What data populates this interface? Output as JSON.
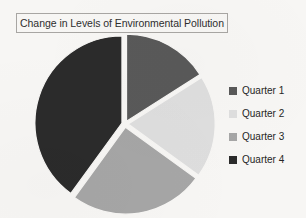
{
  "page": {
    "background_color": "#f7f6f4"
  },
  "title": {
    "text": "Change in Levels of Environmental Pollution",
    "border_color": "#a8a6a3"
  },
  "legend": {
    "items": [
      {
        "label": "Quarter 1",
        "color": "#595959"
      },
      {
        "label": "Quarter 2",
        "color": "#dedede"
      },
      {
        "label": "Quarter 3",
        "color": "#a6a6a6"
      },
      {
        "label": "Quarter 4",
        "color": "#2b2b2b"
      }
    ]
  },
  "chart_data": {
    "type": "pie",
    "title": "Change in Levels of Environmental Pollution",
    "categories": [
      "Quarter 1",
      "Quarter 2",
      "Quarter 3",
      "Quarter 4"
    ],
    "values": [
      16,
      19,
      25,
      40
    ],
    "value_unit": "percent",
    "colors": [
      "#595959",
      "#dedede",
      "#a6a6a6",
      "#2b2b2b"
    ],
    "legend_position": "right",
    "exploded": true,
    "gap_color": "#f7f6f4",
    "start_angle_deg": 0,
    "direction": "clockwise",
    "slice_angles_deg": [
      57.6,
      68.4,
      90.0,
      144.0
    ],
    "labels_shown": false,
    "grid": false,
    "xlabel": "",
    "ylabel": ""
  }
}
